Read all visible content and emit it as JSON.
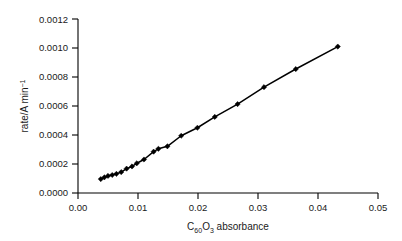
{
  "chart_data": {
    "type": "line",
    "title": "",
    "xlabel": "C60O3 absorbance",
    "xlabel_parts": {
      "lead": "C",
      "sub1": "60",
      "mid": "O",
      "sub2": "3",
      "tail": " absorbance"
    },
    "ylabel": "rate/A min−1",
    "ylabel_parts": {
      "lead": "rate/A min",
      "sup": "−1"
    },
    "xlim": [
      0.0,
      0.05
    ],
    "ylim": [
      0.0,
      0.0012
    ],
    "grid": false,
    "legend": null,
    "marker": "diamond",
    "line_color": "#000000",
    "marker_color": "#000000",
    "xticks": [
      0.0,
      0.01,
      0.02,
      0.03,
      0.04,
      0.05
    ],
    "xtick_labels": [
      "0.00",
      "0.01",
      "0.02",
      "0.03",
      "0.04",
      "0.05"
    ],
    "yticks": [
      0.0,
      0.0002,
      0.0004,
      0.0006,
      0.0008,
      0.001,
      0.0012
    ],
    "ytick_labels": [
      "0.0000",
      "0.0002",
      "0.0004",
      "0.0006",
      "0.0008",
      "0.0010",
      "0.0012"
    ],
    "x": [
      0.0038,
      0.0044,
      0.005,
      0.0057,
      0.0064,
      0.0072,
      0.0081,
      0.009,
      0.0098,
      0.011,
      0.0126,
      0.0134,
      0.0149,
      0.0172,
      0.0199,
      0.0228,
      0.0266,
      0.031,
      0.0363,
      0.0433
    ],
    "values": [
      9.6e-05,
      0.000108,
      0.000118,
      0.000124,
      0.000132,
      0.000144,
      0.000168,
      0.000183,
      0.000205,
      0.000231,
      0.000285,
      0.000305,
      0.000322,
      0.000395,
      0.00045,
      0.000525,
      0.000613,
      0.00073,
      0.000855,
      0.00101
    ],
    "series_name": "rate vs absorbance"
  },
  "figure": {
    "background_color": "#ffffff",
    "axis_color": "#000000",
    "text_color": "#1a1a1a"
  }
}
